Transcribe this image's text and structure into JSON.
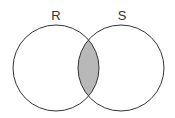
{
  "diagram": {
    "type": "venn",
    "sets": [
      {
        "label": "R",
        "cx": 56,
        "cy": 68,
        "r": 43
      },
      {
        "label": "S",
        "cx": 121,
        "cy": 68,
        "r": 43
      }
    ],
    "shaded_region": "R ∩ S",
    "colors": {
      "stroke": "#333333",
      "fill_shaded": "#b8b8b8",
      "background": "#ffffff"
    }
  }
}
